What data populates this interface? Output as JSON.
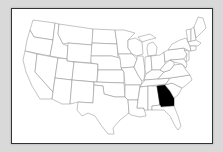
{
  "map": {
    "title": "",
    "region": "United States (contiguous)",
    "highlighted_state": "Georgia",
    "highlight_color": "#000000",
    "state_fill": "#ffffff",
    "state_stroke": "#888888",
    "background_color": "#d9d9d9",
    "frame_border_color": "#333333"
  }
}
